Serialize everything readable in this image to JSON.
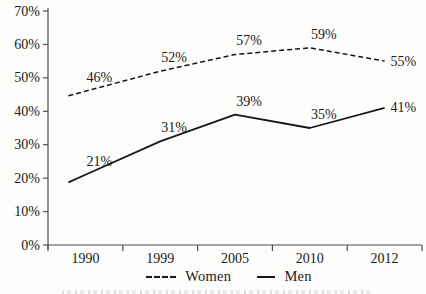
{
  "chart_data": {
    "type": "line",
    "categories": [
      "1990",
      "1999",
      "2005",
      "2010",
      "2012"
    ],
    "series": [
      {
        "name": "Women",
        "style": "dashed",
        "values": [
          46,
          52,
          57,
          59,
          55
        ],
        "data_labels": [
          "46%",
          "52%",
          "57%",
          "59%",
          "55%"
        ]
      },
      {
        "name": "Men",
        "style": "solid",
        "values": [
          21,
          31,
          39,
          35,
          41
        ],
        "data_labels": [
          "21%",
          "31%",
          "39%",
          "35%",
          "41%"
        ]
      }
    ],
    "title": "",
    "xlabel": "",
    "ylabel": "",
    "ylim": [
      0,
      70
    ],
    "ytick_step": 10,
    "ytick_labels": [
      "0%",
      "10%",
      "20%",
      "30%",
      "40%",
      "50%",
      "60%",
      "70%"
    ],
    "grid": false,
    "legend_position": "bottom-center"
  },
  "colors": {
    "line": "#171717",
    "axis": "#4d4d4d",
    "text": "#1a1a1a",
    "background": "#fdfdfb"
  }
}
